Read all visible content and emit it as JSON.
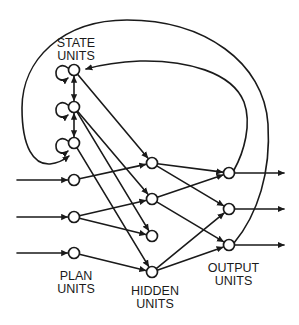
{
  "diagram": {
    "colors": {
      "stroke": "#1a1a1a",
      "background": "#ffffff",
      "node_fill": "#ffffff"
    },
    "node_radius": 5.5,
    "labels": {
      "state": {
        "line1": "STATE",
        "line2": "UNITS"
      },
      "plan": {
        "line1": "PLAN",
        "line2": "UNITS"
      },
      "hidden": {
        "line1": "HIDDEN",
        "line2": "UNITS"
      },
      "output": {
        "line1": "OUTPUT",
        "line2": "UNITS"
      }
    },
    "nodes": [
      {
        "id": "state1",
        "group": "state",
        "x": 74,
        "y": 70
      },
      {
        "id": "state2",
        "group": "state",
        "x": 74,
        "y": 107
      },
      {
        "id": "state3",
        "group": "state",
        "x": 74,
        "y": 143
      },
      {
        "id": "plan1",
        "group": "plan",
        "x": 74,
        "y": 180
      },
      {
        "id": "plan2",
        "group": "plan",
        "x": 74,
        "y": 217
      },
      {
        "id": "plan3",
        "group": "plan",
        "x": 74,
        "y": 253
      },
      {
        "id": "hidden1",
        "group": "hidden",
        "x": 152,
        "y": 163
      },
      {
        "id": "hidden2",
        "group": "hidden",
        "x": 152,
        "y": 199
      },
      {
        "id": "hidden3",
        "group": "hidden",
        "x": 152,
        "y": 236
      },
      {
        "id": "hidden4",
        "group": "hidden",
        "x": 152,
        "y": 272
      },
      {
        "id": "output1",
        "group": "output",
        "x": 229,
        "y": 173
      },
      {
        "id": "output2",
        "group": "output",
        "x": 229,
        "y": 209
      },
      {
        "id": "output3",
        "group": "output",
        "x": 229,
        "y": 245
      }
    ],
    "edges": [
      {
        "kind": "input",
        "from_point": [
          17,
          180
        ],
        "to": "plan1",
        "arrow_end": true
      },
      {
        "kind": "input",
        "from_point": [
          17,
          217
        ],
        "to": "plan2",
        "arrow_end": true
      },
      {
        "kind": "input",
        "from_point": [
          17,
          253
        ],
        "to": "plan3",
        "arrow_end": true
      },
      {
        "kind": "self-loop",
        "node": "state1"
      },
      {
        "kind": "self-loop",
        "node": "state2"
      },
      {
        "kind": "self-loop",
        "node": "state3"
      },
      {
        "kind": "lateral",
        "from": "state1",
        "to": "state2",
        "arrow_start": true,
        "arrow_end": true
      },
      {
        "kind": "lateral",
        "from": "state2",
        "to": "state3",
        "arrow_start": true,
        "arrow_end": true
      },
      {
        "kind": "feedforward",
        "from": "state1",
        "to": "hidden1",
        "arrow_end": true
      },
      {
        "kind": "feedforward",
        "from": "state2",
        "to": "hidden2",
        "arrow_end": true
      },
      {
        "kind": "feedforward",
        "from": "state2",
        "to": "hidden3",
        "arrow_end": true
      },
      {
        "kind": "feedforward",
        "from": "state3",
        "to": "hidden4",
        "arrow_end": true
      },
      {
        "kind": "feedforward",
        "from": "plan1",
        "to": "hidden1",
        "arrow_end": true
      },
      {
        "kind": "feedforward",
        "from": "plan2",
        "to": "hidden2",
        "arrow_end": true
      },
      {
        "kind": "feedforward",
        "from": "plan2",
        "to": "hidden3",
        "arrow_end": true
      },
      {
        "kind": "feedforward",
        "from": "plan3",
        "to": "hidden4",
        "arrow_end": true
      },
      {
        "kind": "feedforward",
        "from": "hidden1",
        "to": "output1",
        "arrow_end": true
      },
      {
        "kind": "feedforward",
        "from": "hidden1",
        "to": "output2",
        "arrow_end": true
      },
      {
        "kind": "feedforward",
        "from": "hidden2",
        "to": "output1",
        "arrow_end": true
      },
      {
        "kind": "feedforward",
        "from": "hidden2",
        "to": "output3",
        "arrow_end": true
      },
      {
        "kind": "feedforward",
        "from": "hidden4",
        "to": "output2",
        "arrow_end": true
      },
      {
        "kind": "feedforward",
        "from": "hidden4",
        "to": "output3",
        "arrow_end": true
      },
      {
        "kind": "output",
        "from": "output1",
        "to_point": [
          284,
          173
        ],
        "arrow_end": true
      },
      {
        "kind": "output",
        "from": "output2",
        "to_point": [
          284,
          209
        ],
        "arrow_end": true
      },
      {
        "kind": "output",
        "from": "output3",
        "to_point": [
          284,
          245
        ],
        "arrow_end": true
      },
      {
        "kind": "recurrent",
        "from": "output1",
        "to": "state1",
        "arrow_end": true,
        "path": "M 234 170 C 244 152, 252 124, 244 102 C 232 72, 186 60, 140 61 C 116 62, 100 65, 86 69"
      },
      {
        "kind": "recurrent",
        "from": "output3",
        "to": "state3",
        "arrow_end": true,
        "path": "M 234 243 C 258 214, 271 172, 268 124 C 264 62, 204 20, 127 20 C 62 20, 22 60, 22 108 C 22 148, 34 165, 50 164 C 58 163, 64 160, 69 156"
      }
    ]
  }
}
